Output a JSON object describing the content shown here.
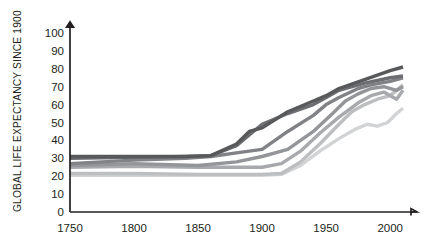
{
  "chart_data": {
    "type": "line",
    "title": "",
    "subtitle": "",
    "xlabel": "",
    "ylabel": "GLOBAL LIFE EXPECTANCY SINCE 1900",
    "xlim": [
      1750,
      2010
    ],
    "ylim": [
      0,
      100
    ],
    "grid": false,
    "legend_position": "none",
    "x_ticks": [
      "1750",
      "1800",
      "1850",
      "1900",
      "1950",
      "2000"
    ],
    "x_tick_values": [
      1750,
      1800,
      1850,
      1900,
      1950,
      2000
    ],
    "y_ticks": [
      "0",
      "10",
      "20",
      "30",
      "40",
      "50",
      "60",
      "70",
      "80",
      "90",
      "100"
    ],
    "y_tick_values": [
      0,
      10,
      20,
      30,
      40,
      50,
      60,
      70,
      80,
      90,
      100
    ],
    "series": [
      {
        "name": "series-1",
        "color": "#58595b",
        "width": 3.4,
        "x": [
          1750,
          1800,
          1840,
          1860,
          1880,
          1890,
          1900,
          1920,
          1940,
          1950,
          1960,
          1980,
          2000,
          2010
        ],
        "values": [
          31,
          31,
          31,
          31.5,
          38,
          45,
          47,
          56,
          62,
          65,
          69,
          74,
          79,
          81
        ]
      },
      {
        "name": "series-2",
        "color": "#6d6e71",
        "width": 3.4,
        "x": [
          1750,
          1800,
          1840,
          1860,
          1880,
          1890,
          1900,
          1920,
          1940,
          1950,
          1960,
          1980,
          2000,
          2010
        ],
        "values": [
          30,
          30.5,
          31,
          31.5,
          37,
          43,
          49,
          55,
          60,
          64,
          68,
          72,
          75,
          76
        ]
      },
      {
        "name": "series-3",
        "color": "#808285",
        "width": 3.4,
        "x": [
          1750,
          1800,
          1840,
          1860,
          1880,
          1900,
          1920,
          1940,
          1950,
          1960,
          1975,
          1985,
          2000,
          2010
        ],
        "values": [
          27,
          29,
          30,
          31,
          33,
          35,
          45,
          54,
          60,
          64,
          69,
          71,
          73,
          75
        ]
      },
      {
        "name": "series-4",
        "color": "#939598",
        "width": 3.4,
        "x": [
          1750,
          1800,
          1850,
          1880,
          1900,
          1920,
          1940,
          1955,
          1965,
          1975,
          1985,
          1995,
          2005,
          2010
        ],
        "values": [
          26,
          27,
          26,
          28,
          31,
          35,
          45,
          55,
          62,
          66,
          69,
          70,
          68,
          70
        ]
      },
      {
        "name": "series-5",
        "color": "#a7a9ac",
        "width": 3.4,
        "x": [
          1750,
          1800,
          1850,
          1875,
          1900,
          1915,
          1930,
          1945,
          1960,
          1975,
          1985,
          1995,
          2005,
          2010
        ],
        "values": [
          25,
          25.5,
          25,
          25,
          25,
          27,
          34,
          44,
          53,
          61,
          65,
          67,
          63,
          68
        ]
      },
      {
        "name": "series-6",
        "color": "#bcbec0",
        "width": 3.4,
        "x": [
          1750,
          1800,
          1850,
          1880,
          1900,
          1915,
          1930,
          1945,
          1960,
          1970,
          1980,
          1990,
          2000,
          2010
        ],
        "values": [
          21.5,
          21.5,
          21,
          21,
          21,
          21.5,
          28,
          38,
          49,
          56,
          60,
          63,
          65,
          71
        ]
      },
      {
        "name": "series-7",
        "color": "#d1d3d4",
        "width": 3.4,
        "x": [
          1750,
          1800,
          1850,
          1880,
          1900,
          1915,
          1930,
          1945,
          1960,
          1972,
          1982,
          1990,
          1998,
          2005,
          2010
        ],
        "values": [
          20.5,
          20.5,
          20.5,
          20.5,
          20.5,
          21,
          26,
          34,
          41,
          46,
          49,
          48,
          50,
          55,
          58
        ]
      }
    ]
  },
  "axis": {
    "y_title": "GLOBAL LIFE EXPECTANCY SINCE 1900"
  }
}
